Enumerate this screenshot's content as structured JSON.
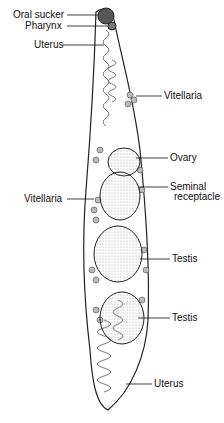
{
  "diagram": {
    "labels": {
      "oral_sucker": "Oral sucker",
      "pharynx": "Pharynx",
      "uterus_top": "Uterus",
      "vitellaria_right": "Vitellaria",
      "ovary": "Ovary",
      "seminal_receptacle_1": "Seminal",
      "seminal_receptacle_2": "receptacle",
      "vitellaria_left": "Vitellaria",
      "testis_upper": "Testis",
      "testis_lower": "Testis",
      "uterus_bottom": "Uterus"
    }
  }
}
